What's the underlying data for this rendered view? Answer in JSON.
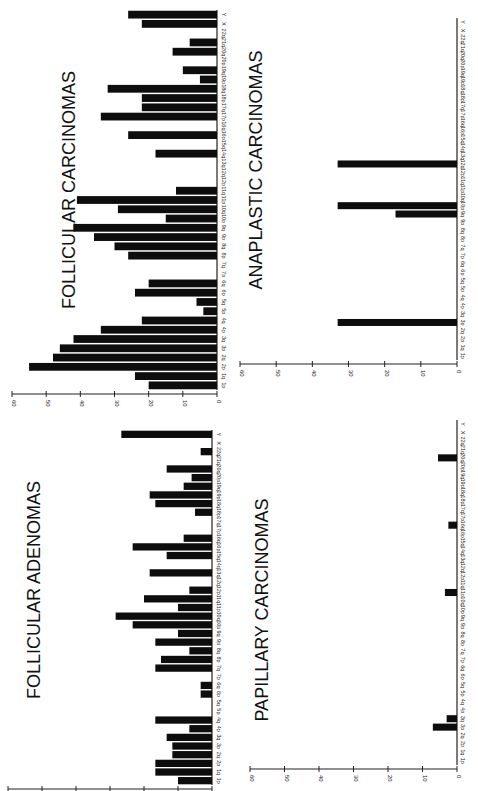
{
  "orientation": "rotated 90 degrees counter-clockwise",
  "chart_data": [
    {
      "id": "follicular-carcinomas",
      "type": "bar",
      "title": "FOLLICULAR CARCINOMAS",
      "xlabel": "",
      "ylabel": "",
      "ylim": [
        0,
        60
      ],
      "yticks": [
        0,
        10,
        20,
        30,
        40,
        50,
        60
      ],
      "categories": [
        "1p",
        "1q",
        "2p",
        "2q",
        "3p",
        "3q",
        "4p",
        "4q",
        "5p",
        "5q",
        "6p",
        "6q",
        "7p",
        "7q",
        "8p",
        "8q",
        "9p",
        "9q",
        "10p",
        "10q",
        "11p",
        "11q",
        "12p",
        "12q",
        "13q",
        "14q",
        "15q",
        "16p",
        "16q",
        "17p",
        "17q",
        "18p",
        "18q",
        "19p",
        "19q",
        "20p",
        "20q",
        "21q",
        "22q",
        "X",
        "Y"
      ],
      "values": [
        20,
        24,
        55,
        48,
        46,
        42,
        34,
        22,
        4,
        6,
        24,
        20,
        0,
        0,
        26,
        30,
        36,
        42,
        15,
        29,
        41,
        12,
        0,
        0,
        0,
        18,
        0,
        26,
        0,
        34,
        22,
        22,
        32,
        5,
        10,
        0,
        13,
        8,
        0,
        22,
        26
      ],
      "grid": false
    },
    {
      "id": "follicular-adenomas",
      "type": "bar",
      "title": "FOLLICULAR ADENOMAS",
      "xlabel": "",
      "ylabel": "",
      "ylim": [
        0,
        18
      ],
      "yticks": [
        0,
        3,
        6,
        9,
        12,
        15,
        18
      ],
      "categories": [
        "1p",
        "1q",
        "2p",
        "2q",
        "3p",
        "3q",
        "4p",
        "4q",
        "5p",
        "5q",
        "6p",
        "6q",
        "7p",
        "7q",
        "8p",
        "8q",
        "9p",
        "9q",
        "10p",
        "10q",
        "11p",
        "11q",
        "12p",
        "12q",
        "13q",
        "14q",
        "15q",
        "16p",
        "16q",
        "17p",
        "17q",
        "18p",
        "18q",
        "19p",
        "19q",
        "20p",
        "20q",
        "21q",
        "22q",
        "X",
        "Y"
      ],
      "values": [
        3,
        5,
        5,
        3.5,
        3.5,
        4,
        2,
        5,
        0,
        0,
        1,
        1,
        0,
        5,
        4.5,
        2,
        5,
        3,
        7,
        8.5,
        3,
        6,
        2,
        0,
        5.5,
        0,
        4,
        7,
        2.5,
        0,
        0,
        1.5,
        5,
        5.5,
        2.5,
        1.8,
        4,
        0,
        1,
        0,
        8
      ],
      "grid": false
    },
    {
      "id": "anaplastic-carcinomas",
      "type": "bar",
      "title": "ANAPLASTIC CARCINOMAS",
      "xlabel": "",
      "ylabel": "",
      "ylim": [
        0,
        60
      ],
      "yticks": [
        0,
        10,
        20,
        30,
        40,
        50,
        60
      ],
      "categories": [
        "1p",
        "1q",
        "2p",
        "2q",
        "3p",
        "3q",
        "4p",
        "4q",
        "5p",
        "5q",
        "6p",
        "6q",
        "7p",
        "7q",
        "8p",
        "8q",
        "9p",
        "9q",
        "10p",
        "10q",
        "11p",
        "11q",
        "12p",
        "12q",
        "13q",
        "14q",
        "15q",
        "16p",
        "16q",
        "17p",
        "17q",
        "18p",
        "18q",
        "19p",
        "19q",
        "20p",
        "20q",
        "21q",
        "22q",
        "X",
        "Y"
      ],
      "values": [
        0,
        0,
        0,
        0,
        33,
        0,
        0,
        0,
        0,
        0,
        0,
        0,
        0,
        0,
        0,
        0,
        0,
        17,
        33,
        0,
        0,
        0,
        0,
        33,
        0,
        0,
        0,
        0,
        0,
        0,
        0,
        0,
        0,
        0,
        0,
        0,
        0,
        0,
        0,
        0,
        0
      ],
      "grid": false
    },
    {
      "id": "papillary-carcinomas",
      "type": "bar",
      "title": "PAPILLARY CARCINOMAS",
      "xlabel": "",
      "ylabel": "",
      "ylim": [
        0,
        60
      ],
      "yticks": [
        0,
        10,
        20,
        30,
        40,
        50,
        60
      ],
      "categories": [
        "1p",
        "1q",
        "2p",
        "2q",
        "3p",
        "3q",
        "4p",
        "4q",
        "5p",
        "5q",
        "6p",
        "6q",
        "7p",
        "7q",
        "8p",
        "8q",
        "9p",
        "9q",
        "10p",
        "10q",
        "11p",
        "11q",
        "12p",
        "12q",
        "13q",
        "14q",
        "15q",
        "16p",
        "16q",
        "17p",
        "17q",
        "18p",
        "18q",
        "19p",
        "19q",
        "20p",
        "20q",
        "21q",
        "22q",
        "X",
        "Y"
      ],
      "values": [
        0,
        0,
        0,
        0,
        7,
        3,
        0,
        0,
        0,
        0,
        0,
        0,
        0,
        0,
        0,
        0,
        0,
        0,
        0,
        0,
        3.5,
        0,
        0,
        0,
        0,
        0,
        0,
        0,
        2.5,
        0,
        0,
        0,
        0,
        0,
        0,
        0,
        5.5,
        0,
        0,
        0,
        0
      ],
      "grid": false
    }
  ]
}
